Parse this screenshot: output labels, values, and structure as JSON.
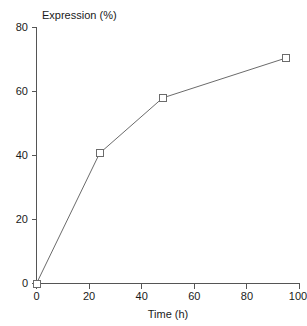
{
  "chart_data": {
    "type": "line",
    "title": "",
    "xlabel": "Time (h)",
    "ylabel": "Expression (%)",
    "xlim": [
      0,
      100
    ],
    "ylim": [
      0,
      80
    ],
    "grid": false,
    "legend": null,
    "marker": "open-square",
    "line_color": "#6b6b6b",
    "marker_fill": "#ffffff",
    "marker_edge_color": "#6b6b6b",
    "axis_color": "#555555",
    "background_color": "#ffffff",
    "xticks": [
      0,
      20,
      40,
      60,
      80,
      100
    ],
    "xtick_labels": [
      "0",
      "20",
      "40",
      "60",
      "80",
      "100"
    ],
    "yticks": [
      0,
      20,
      40,
      60,
      80
    ],
    "ytick_labels": [
      "0",
      "20",
      "40",
      "60",
      "80"
    ],
    "x": [
      0,
      24,
      48,
      95
    ],
    "y": [
      0,
      40.7,
      58,
      70.5
    ],
    "series": [
      {
        "name": "Expression",
        "points": [
          {
            "x": 0,
            "y": 0
          },
          {
            "x": 24,
            "y": 40.7
          },
          {
            "x": 48,
            "y": 58
          },
          {
            "x": 95,
            "y": 70.5
          }
        ]
      }
    ]
  },
  "labels": {
    "y_axis_title": "Expression (%)",
    "x_axis_title": "Time (h)",
    "y_tick_0": "0",
    "y_tick_1": "20",
    "y_tick_2": "40",
    "y_tick_3": "60",
    "y_tick_4": "80",
    "x_tick_0": "0",
    "x_tick_1": "20",
    "x_tick_2": "40",
    "x_tick_3": "60",
    "x_tick_4": "80",
    "x_tick_5": "100"
  }
}
